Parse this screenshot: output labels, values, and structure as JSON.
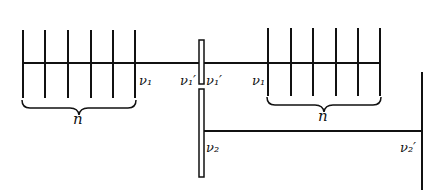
{
  "diagram": {
    "stroke_color": "#111111",
    "background": "#ffffff",
    "left_comb": {
      "tick_count": 6,
      "brace_label": "n",
      "end_label": "ν₁"
    },
    "right_comb": {
      "tick_count": 6,
      "brace_label": "n",
      "start_label": "ν₁"
    },
    "center_bar": {
      "left_label": "ν₁′",
      "right_label": "ν₁′",
      "lower_label": "ν₂"
    },
    "lower_line": {
      "end_label": "ν₂′"
    }
  }
}
